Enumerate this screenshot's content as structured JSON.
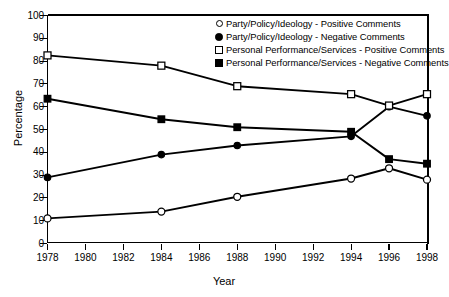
{
  "chart_data": {
    "type": "line",
    "title": "",
    "xlabel": "Year",
    "ylabel": "Percentage",
    "xlim": [
      1978,
      1998
    ],
    "ylim": [
      0,
      100
    ],
    "xticks": [
      1978,
      1980,
      1982,
      1984,
      1986,
      1988,
      1990,
      1992,
      1994,
      1996,
      1998
    ],
    "yticks": [
      0,
      10,
      20,
      30,
      40,
      50,
      60,
      70,
      80,
      90,
      100
    ],
    "grid": false,
    "legend_position": "top-right",
    "x": [
      1978,
      1984,
      1988,
      1994,
      1996,
      1998
    ],
    "series": [
      {
        "name": "Party/Policy/Ideology - Positive Comments",
        "marker": "open-circle",
        "values": [
          11,
          14,
          20.5,
          28.5,
          33,
          28
        ]
      },
      {
        "name": "Party/Policy/Ideology - Negative Comments",
        "marker": "filled-circle",
        "values": [
          29,
          39,
          43,
          47,
          60,
          56
        ]
      },
      {
        "name": "Personal Performance/Services - Positive Comments",
        "marker": "open-square",
        "values": [
          82.5,
          78,
          69,
          65.5,
          60.5,
          65.5
        ]
      },
      {
        "name": "Personal Performance/Services - Negative Comments",
        "marker": "filled-square",
        "values": [
          63.5,
          54.5,
          51,
          49,
          37,
          35
        ]
      }
    ]
  },
  "axes": {
    "y_tick_labels": [
      "100",
      "90",
      "80",
      "70",
      "60",
      "50",
      "40",
      "30",
      "20",
      "10",
      "0"
    ],
    "x_tick_labels": [
      "1978",
      "1980",
      "1982",
      "1984",
      "1986",
      "1988",
      "1990",
      "1992",
      "1994",
      "1996",
      "1998"
    ],
    "y_axis_title": "Percentage",
    "x_axis_title": "Year"
  },
  "legend": {
    "items": [
      {
        "label": "Party/Policy/Ideology - Positive Comments",
        "marker": "open-circle"
      },
      {
        "label": "Party/Policy/Ideology - Negative Comments",
        "marker": "filled-circle"
      },
      {
        "label": "Personal Performance/Services - Positive Comments",
        "marker": "open-square"
      },
      {
        "label": "Personal Performance/Services - Negative Comments",
        "marker": "filled-square"
      }
    ]
  },
  "colors": {
    "line": "#000000",
    "background": "#ffffff",
    "axis": "#000000"
  }
}
